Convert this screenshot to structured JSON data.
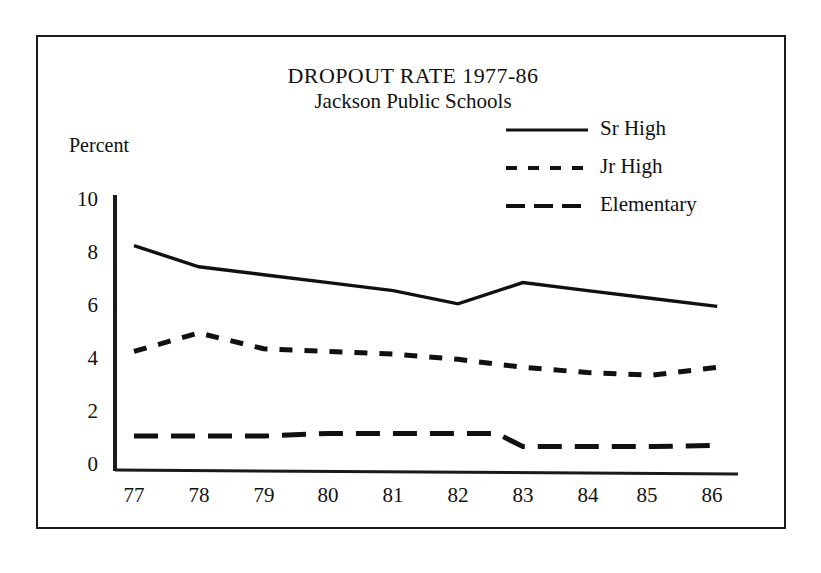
{
  "figure": {
    "title": "DROPOUT RATE 1977-86",
    "subtitle": "Jackson Public Schools",
    "ylabel": "Percent",
    "frame_color": "#1a1a1a",
    "background": "#ffffff"
  },
  "axes": {
    "y_ticks": [
      "10",
      "8",
      "6",
      "4",
      "2",
      "0"
    ],
    "x_ticks": [
      "77",
      "78",
      "79",
      "80",
      "81",
      "82",
      "83",
      "84",
      "85",
      "86"
    ]
  },
  "legend": {
    "items": [
      {
        "label": "Sr High",
        "style": "solid"
      },
      {
        "label": "Jr High",
        "style": "short-dash"
      },
      {
        "label": "Elementary",
        "style": "long-dash"
      }
    ]
  },
  "chart_data": {
    "type": "line",
    "title": "DROPOUT RATE 1977-86",
    "subtitle": "Jackson Public Schools",
    "xlabel": "",
    "ylabel": "Percent",
    "categories": [
      "77",
      "78",
      "79",
      "80",
      "81",
      "82",
      "83",
      "84",
      "85",
      "86"
    ],
    "x": [
      1977,
      1978,
      1979,
      1980,
      1981,
      1982,
      1983,
      1984,
      1985,
      1986
    ],
    "ylim": [
      0,
      10
    ],
    "yticks": [
      0,
      2,
      4,
      6,
      8,
      10
    ],
    "grid": false,
    "legend_position": "top-right",
    "series": [
      {
        "name": "Sr High",
        "style": "solid",
        "color": "#111111",
        "values": [
          8.2,
          7.4,
          7.1,
          6.8,
          6.5,
          6.0,
          6.8,
          6.5,
          6.2,
          5.9
        ]
      },
      {
        "name": "Jr High",
        "style": "short-dash",
        "color": "#111111",
        "values": [
          4.2,
          4.9,
          4.3,
          4.2,
          4.1,
          3.9,
          3.6,
          3.4,
          3.3,
          3.6
        ]
      },
      {
        "name": "Elementary",
        "style": "long-dash",
        "color": "#111111",
        "values": [
          1.0,
          1.0,
          1.0,
          1.1,
          1.1,
          1.1,
          0.6,
          0.6,
          0.6,
          0.65
        ]
      }
    ]
  }
}
